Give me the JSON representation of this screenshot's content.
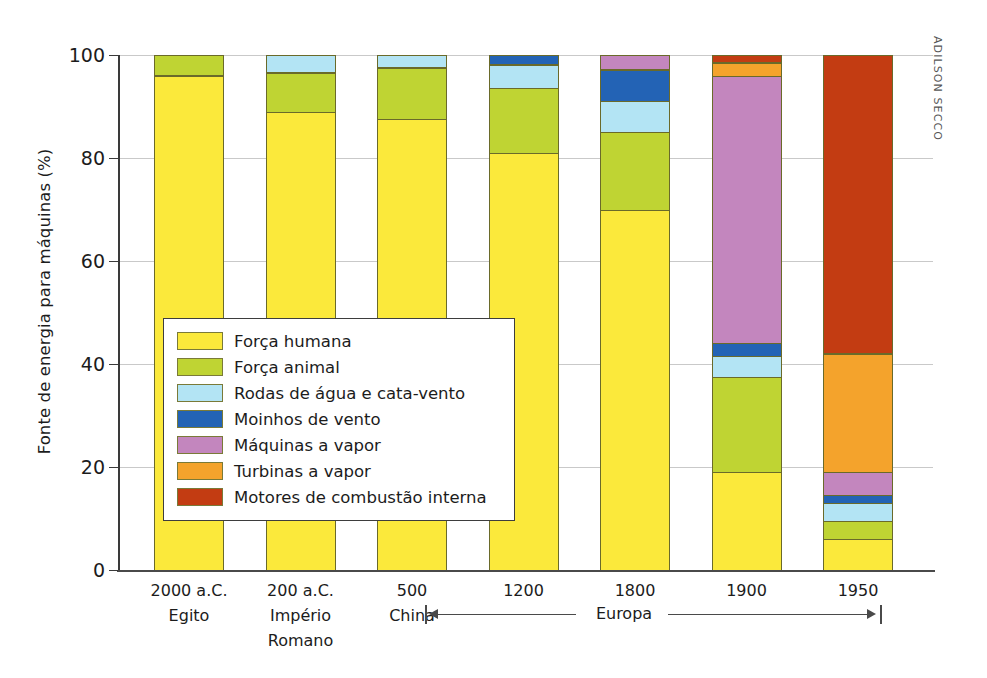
{
  "credit": "ADILSON SECCO",
  "axis": {
    "ylabel": "Fonte de energia para máquinas (%)",
    "yticks": [
      "0",
      "20",
      "40",
      "60",
      "80",
      "100"
    ]
  },
  "europa_span": {
    "label": "Europa"
  },
  "legend": {
    "items": [
      {
        "label": "Força humana",
        "color": "#fbe93b"
      },
      {
        "label": "Força animal",
        "color": "#bfd433"
      },
      {
        "label": "Rodas de água e cata-vento",
        "color": "#b3e4f4"
      },
      {
        "label": "Moinhos de vento",
        "color": "#2363b5"
      },
      {
        "label": "Máquinas a vapor",
        "color": "#c386be"
      },
      {
        "label": "Turbinas a vapor",
        "color": "#f4a32c"
      },
      {
        "label": "Motores de combustão interna",
        "color": "#c33c12"
      }
    ]
  },
  "chart_data": {
    "type": "bar",
    "subtype": "stacked-100",
    "title": "",
    "xlabel": "",
    "ylabel": "Fonte de energia para máquinas (%)",
    "ylim": [
      0,
      100
    ],
    "yticks": [
      0,
      20,
      40,
      60,
      80,
      100
    ],
    "grid": true,
    "legend_position": "inside-center-left",
    "categories": [
      "2000 a.C.",
      "200 a.C.",
      "500",
      "1200",
      "1800",
      "1900",
      "1950"
    ],
    "category_sublabels": [
      "Egito",
      "Império Romano",
      "China",
      "",
      "",
      "",
      ""
    ],
    "series": [
      {
        "name": "Força humana",
        "color": "#fbe93b",
        "values": [
          96,
          89,
          87.5,
          81,
          70,
          19,
          6
        ]
      },
      {
        "name": "Força animal",
        "color": "#bfd433",
        "values": [
          4,
          7.5,
          10,
          12.5,
          15,
          18.5,
          3.5
        ]
      },
      {
        "name": "Rodas de água e cata-vento",
        "color": "#b3e4f4",
        "values": [
          0,
          3.5,
          2.5,
          4.5,
          6,
          4,
          3.5
        ]
      },
      {
        "name": "Moinhos de vento",
        "color": "#2363b5",
        "values": [
          0,
          0,
          0,
          2,
          6,
          2.5,
          1.5
        ]
      },
      {
        "name": "Máquinas a vapor",
        "color": "#c386be",
        "values": [
          0,
          0,
          0,
          0,
          3,
          52,
          4.5
        ]
      },
      {
        "name": "Turbinas a vapor",
        "color": "#f4a32c",
        "values": [
          0,
          0,
          0,
          0,
          0,
          2.5,
          23
        ]
      },
      {
        "name": "Motores de combustão interna",
        "color": "#c33c12",
        "values": [
          0,
          0,
          0,
          0,
          0,
          1.5,
          58
        ]
      }
    ]
  }
}
